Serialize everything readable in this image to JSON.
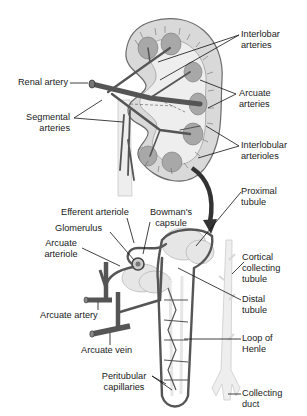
{
  "colors": {
    "background": "#ffffff",
    "kidney_cortex": "#d9d9d9",
    "kidney_outline": "#6b6b6b",
    "pyramid": "#a8a8a8",
    "vessel": "#555555",
    "pelvis": "#eeeeee",
    "tubule": "#e6e6e6",
    "arrow": "#333333",
    "leader_line": "#111111",
    "text": "#1a1a1a"
  },
  "kidney_labels": {
    "interlobar": [
      "Interlobar",
      "arteries"
    ],
    "renal_artery": [
      "Renal artery"
    ],
    "arcuate": [
      "Arcuate",
      "arteries"
    ],
    "segmental": [
      "Segmental",
      "arteries"
    ],
    "interlobular": [
      "Interlobular",
      "arterioles"
    ]
  },
  "nephron_labels": {
    "proximal": [
      "Proximal",
      "tubule"
    ],
    "efferent": [
      "Efferent arteriole"
    ],
    "bowmans": [
      "Bowman's",
      "capsule"
    ],
    "glomerulus": [
      "Glomerulus"
    ],
    "arcuate_arteriole": [
      "Arcuate",
      "arteriole"
    ],
    "cortical": [
      "Cortical",
      "collecting",
      "tubule"
    ],
    "distal": [
      "Distal",
      "tubule"
    ],
    "arcuate_artery": [
      "Arcuate artery"
    ],
    "loop": [
      "Loop of",
      "Henle"
    ],
    "arcuate_vein": [
      "Arcuate vein"
    ],
    "peritubular": [
      "Peritubular",
      "capillaries"
    ],
    "collecting_duct": [
      "Collecting",
      "duct"
    ]
  }
}
